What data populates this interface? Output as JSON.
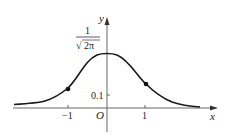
{
  "diagram": {
    "type": "normal-distribution-curve",
    "axes": {
      "x_label": "x",
      "y_label": "y",
      "origin_label": "O"
    },
    "x_ticks": [
      {
        "value": -1,
        "label": "−1"
      },
      {
        "value": 1,
        "label": "1"
      }
    ],
    "y_ticks": [
      {
        "value": 0.1,
        "label": "0.1"
      }
    ],
    "peak_label": {
      "numerator": "1",
      "denominator": "2π",
      "radical": "√"
    },
    "marked_points": [
      {
        "x": -1,
        "description": "inflection point"
      },
      {
        "x": 1,
        "description": "inflection point"
      }
    ],
    "colors": {
      "curve": "#1a1a1a",
      "axis": "#555555",
      "text": "#222222"
    }
  }
}
